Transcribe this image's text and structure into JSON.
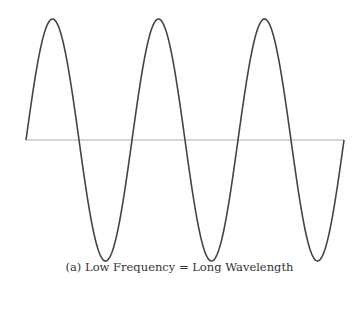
{
  "figure": {
    "caption": "(a) Low Frequency = Long Wavelength",
    "wave": {
      "x_start": 26,
      "x_end": 344,
      "axis_y": 140,
      "amplitude": 121,
      "cycles": 3,
      "stroke_color": "#444444",
      "axis_color": "#aaaaaa"
    }
  },
  "chart_data": {
    "type": "line",
    "title": "(a) Low Frequency = Long Wavelength",
    "xlabel": "",
    "ylabel": "",
    "series": [
      {
        "name": "sine wave",
        "function": "sin",
        "cycles": 3
      }
    ],
    "grid": false
  }
}
